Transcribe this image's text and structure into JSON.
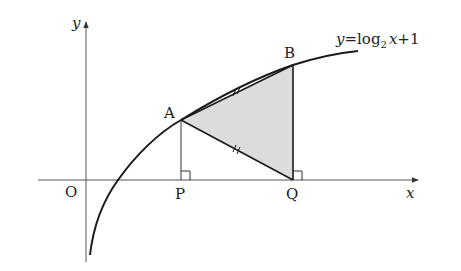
{
  "figure": {
    "curve_label": {
      "y": "y",
      "eq": "=",
      "log": "log",
      "base": "2",
      "x": "x",
      "rest": "+1"
    },
    "axis_labels": {
      "x": "x",
      "y": "y"
    },
    "points": {
      "O": "O",
      "A": "A",
      "B": "B",
      "P": "P",
      "Q": "Q"
    },
    "colors": {
      "line": "#1a1a1a",
      "axis": "#555555",
      "fill": "#d9d9d9"
    }
  }
}
